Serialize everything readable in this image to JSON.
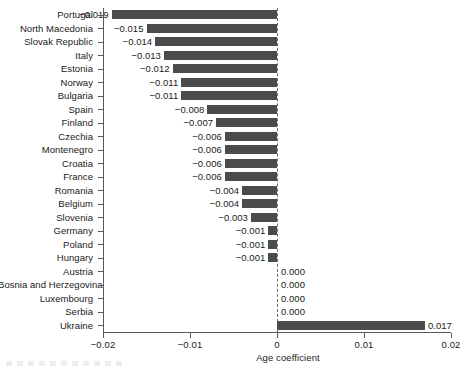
{
  "chart_data": {
    "type": "bar",
    "orientation": "horizontal",
    "title": "",
    "subtitle": "",
    "xlabel": "Age coefficient",
    "ylabel": "",
    "xlim": [
      -0.02,
      0.02
    ],
    "ylim": null,
    "grid": false,
    "legend": null,
    "legend_position": "none",
    "xticks": [
      -0.02,
      -0.01,
      0,
      0.01,
      0.02
    ],
    "xticklabels": [
      "−0.02",
      "−0.01",
      "0",
      "0.01",
      "0.02"
    ],
    "zero_reference_line": true,
    "bar_color": "#4b4b4b",
    "categories": [
      "Portugal",
      "North Macedonia",
      "Slovak Republic",
      "Italy",
      "Estonia",
      "Norway",
      "Bulgaria",
      "Spain",
      "Finland",
      "Czechia",
      "Montenegro",
      "Croatia",
      "France",
      "Romania",
      "Belgium",
      "Slovenia",
      "Germany",
      "Poland",
      "Hungary",
      "Austria",
      "Bosnia and Herzegovina",
      "Luxembourg",
      "Serbia",
      "Ukraine"
    ],
    "values": [
      -0.019,
      -0.015,
      -0.014,
      -0.013,
      -0.012,
      -0.011,
      -0.011,
      -0.008,
      -0.007,
      -0.006,
      -0.006,
      -0.006,
      -0.006,
      -0.004,
      -0.004,
      -0.003,
      -0.001,
      -0.001,
      -0.001,
      0.0,
      0.0,
      0.0,
      0.0,
      0.017
    ],
    "datalabels": [
      "−0.019",
      "−0.015",
      "−0.014",
      "−0.013",
      "−0.012",
      "−0.011",
      "−0.011",
      "−0.008",
      "−0.007",
      "−0.006",
      "−0.006",
      "−0.006",
      "−0.006",
      "−0.004",
      "−0.004",
      "−0.003",
      "−0.001",
      "−0.001",
      "−0.001",
      "0.000",
      "0.000",
      "0.000",
      "0.000",
      "0.017"
    ]
  }
}
